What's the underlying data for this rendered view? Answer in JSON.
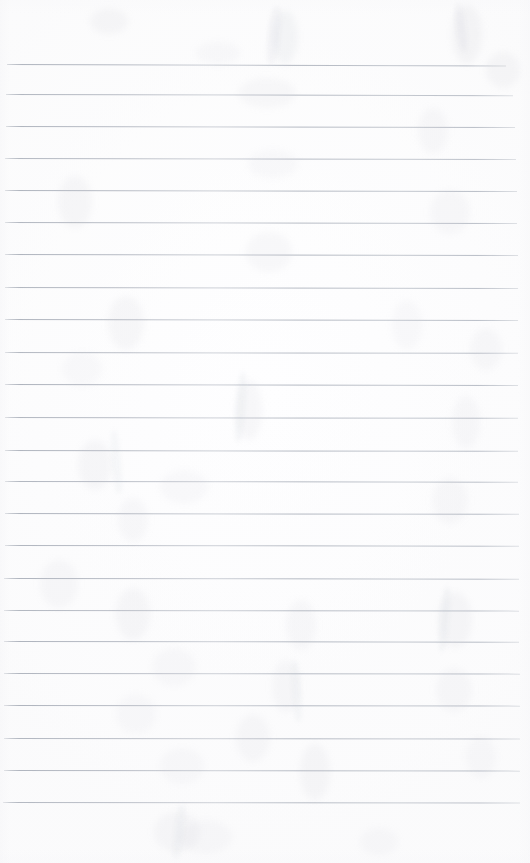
{
  "document": {
    "kind": "scanned-lined-paper",
    "title": "",
    "body_text": "",
    "page_width": 530,
    "page_height": 863,
    "background_color": "#ffffff",
    "is_blank": true
  },
  "ruling": {
    "line_color": "#a9afba",
    "line_thickness_px": 1,
    "line_count": 24,
    "first_line_y": 64,
    "line_spacing_px": 32.1,
    "left_margin_px": 6,
    "right_end_px": 518,
    "margin_rule": false,
    "lines": [
      {
        "y": 64,
        "x": 7,
        "width": 499,
        "tilt": 0.16,
        "opacity": 0.92
      },
      {
        "y": 94,
        "x": 6,
        "width": 507,
        "tilt": 0.13,
        "opacity": 0.88
      },
      {
        "y": 126,
        "x": 6,
        "width": 509,
        "tilt": 0.12,
        "opacity": 0.9
      },
      {
        "y": 158,
        "x": 5,
        "width": 511,
        "tilt": 0.11,
        "opacity": 0.86
      },
      {
        "y": 190,
        "x": 5,
        "width": 512,
        "tilt": 0.12,
        "opacity": 0.9
      },
      {
        "y": 222,
        "x": 5,
        "width": 512,
        "tilt": 0.1,
        "opacity": 0.87
      },
      {
        "y": 254,
        "x": 5,
        "width": 513,
        "tilt": 0.11,
        "opacity": 0.91
      },
      {
        "y": 287,
        "x": 5,
        "width": 513,
        "tilt": 0.1,
        "opacity": 0.88
      },
      {
        "y": 319,
        "x": 5,
        "width": 513,
        "tilt": 0.1,
        "opacity": 0.9
      },
      {
        "y": 352,
        "x": 5,
        "width": 513,
        "tilt": 0.09,
        "opacity": 0.86
      },
      {
        "y": 384,
        "x": 5,
        "width": 513,
        "tilt": 0.1,
        "opacity": 0.92
      },
      {
        "y": 417,
        "x": 5,
        "width": 513,
        "tilt": 0.09,
        "opacity": 0.88
      },
      {
        "y": 450,
        "x": 5,
        "width": 513,
        "tilt": 0.09,
        "opacity": 0.9
      },
      {
        "y": 481,
        "x": 5,
        "width": 513,
        "tilt": 0.08,
        "opacity": 0.87
      },
      {
        "y": 513,
        "x": 5,
        "width": 514,
        "tilt": 0.09,
        "opacity": 0.91
      },
      {
        "y": 545,
        "x": 5,
        "width": 514,
        "tilt": 0.08,
        "opacity": 0.88
      },
      {
        "y": 578,
        "x": 4,
        "width": 515,
        "tilt": 0.08,
        "opacity": 0.9
      },
      {
        "y": 610,
        "x": 4,
        "width": 515,
        "tilt": 0.07,
        "opacity": 0.86
      },
      {
        "y": 641,
        "x": 4,
        "width": 515,
        "tilt": 0.08,
        "opacity": 0.91
      },
      {
        "y": 673,
        "x": 4,
        "width": 516,
        "tilt": 0.07,
        "opacity": 0.88
      },
      {
        "y": 705,
        "x": 4,
        "width": 516,
        "tilt": 0.07,
        "opacity": 0.9
      },
      {
        "y": 738,
        "x": 4,
        "width": 516,
        "tilt": 0.06,
        "opacity": 0.87
      },
      {
        "y": 770,
        "x": 4,
        "width": 516,
        "tilt": 0.07,
        "opacity": 0.89
      },
      {
        "y": 802,
        "x": 3,
        "width": 517,
        "tilt": 0.06,
        "opacity": 0.85
      }
    ]
  },
  "artifacts": {
    "description": "faint scanner ghosting and bleed-through smudges",
    "smudges": [
      {
        "x": 90,
        "y": 8,
        "w": 38,
        "h": 26,
        "opacity": 0.1
      },
      {
        "x": 272,
        "y": 10,
        "w": 26,
        "h": 54,
        "opacity": 0.13
      },
      {
        "x": 452,
        "y": 4,
        "w": 30,
        "h": 60,
        "opacity": 0.12
      },
      {
        "x": 196,
        "y": 42,
        "w": 44,
        "h": 22,
        "opacity": 0.08
      },
      {
        "x": 238,
        "y": 78,
        "w": 58,
        "h": 30,
        "opacity": 0.09
      },
      {
        "x": 486,
        "y": 52,
        "w": 34,
        "h": 36,
        "opacity": 0.1
      },
      {
        "x": 418,
        "y": 108,
        "w": 30,
        "h": 46,
        "opacity": 0.09
      },
      {
        "x": 248,
        "y": 150,
        "w": 50,
        "h": 28,
        "opacity": 0.08
      },
      {
        "x": 58,
        "y": 176,
        "w": 34,
        "h": 52,
        "opacity": 0.1
      },
      {
        "x": 430,
        "y": 190,
        "w": 40,
        "h": 44,
        "opacity": 0.09
      },
      {
        "x": 246,
        "y": 232,
        "w": 46,
        "h": 40,
        "opacity": 0.09
      },
      {
        "x": 108,
        "y": 296,
        "w": 36,
        "h": 54,
        "opacity": 0.1
      },
      {
        "x": 392,
        "y": 300,
        "w": 30,
        "h": 50,
        "opacity": 0.08
      },
      {
        "x": 470,
        "y": 328,
        "w": 32,
        "h": 42,
        "opacity": 0.09
      },
      {
        "x": 62,
        "y": 352,
        "w": 40,
        "h": 34,
        "opacity": 0.08
      },
      {
        "x": 236,
        "y": 380,
        "w": 26,
        "h": 60,
        "opacity": 0.1
      },
      {
        "x": 452,
        "y": 396,
        "w": 28,
        "h": 52,
        "opacity": 0.09
      },
      {
        "x": 78,
        "y": 440,
        "w": 34,
        "h": 50,
        "opacity": 0.1
      },
      {
        "x": 160,
        "y": 470,
        "w": 48,
        "h": 34,
        "opacity": 0.08
      },
      {
        "x": 432,
        "y": 478,
        "w": 36,
        "h": 46,
        "opacity": 0.09
      },
      {
        "x": 118,
        "y": 498,
        "w": 30,
        "h": 44,
        "opacity": 0.09
      },
      {
        "x": 40,
        "y": 560,
        "w": 38,
        "h": 48,
        "opacity": 0.09
      },
      {
        "x": 116,
        "y": 588,
        "w": 34,
        "h": 52,
        "opacity": 0.1
      },
      {
        "x": 286,
        "y": 600,
        "w": 30,
        "h": 50,
        "opacity": 0.09
      },
      {
        "x": 438,
        "y": 592,
        "w": 34,
        "h": 56,
        "opacity": 0.1
      },
      {
        "x": 152,
        "y": 648,
        "w": 44,
        "h": 38,
        "opacity": 0.08
      },
      {
        "x": 272,
        "y": 660,
        "w": 28,
        "h": 52,
        "opacity": 0.09
      },
      {
        "x": 436,
        "y": 668,
        "w": 36,
        "h": 44,
        "opacity": 0.09
      },
      {
        "x": 116,
        "y": 694,
        "w": 40,
        "h": 40,
        "opacity": 0.08
      },
      {
        "x": 236,
        "y": 714,
        "w": 34,
        "h": 48,
        "opacity": 0.09
      },
      {
        "x": 466,
        "y": 736,
        "w": 30,
        "h": 42,
        "opacity": 0.08
      },
      {
        "x": 160,
        "y": 748,
        "w": 44,
        "h": 36,
        "opacity": 0.08
      },
      {
        "x": 300,
        "y": 744,
        "w": 30,
        "h": 56,
        "opacity": 0.1
      },
      {
        "x": 154,
        "y": 812,
        "w": 46,
        "h": 40,
        "opacity": 0.09
      },
      {
        "x": 180,
        "y": 820,
        "w": 52,
        "h": 34,
        "opacity": 0.08
      },
      {
        "x": 360,
        "y": 828,
        "w": 38,
        "h": 28,
        "opacity": 0.07
      }
    ],
    "streaks": [
      {
        "x": 268,
        "y": 6,
        "w": 12,
        "h": 58,
        "rot": 6,
        "opacity": 0.11
      },
      {
        "x": 456,
        "y": 2,
        "w": 10,
        "h": 50,
        "rot": -8,
        "opacity": 0.11
      },
      {
        "x": 236,
        "y": 372,
        "w": 9,
        "h": 70,
        "rot": 4,
        "opacity": 0.1
      },
      {
        "x": 112,
        "y": 430,
        "w": 9,
        "h": 64,
        "rot": -5,
        "opacity": 0.09
      },
      {
        "x": 440,
        "y": 586,
        "w": 9,
        "h": 66,
        "rot": 5,
        "opacity": 0.1
      },
      {
        "x": 292,
        "y": 660,
        "w": 9,
        "h": 62,
        "rot": -4,
        "opacity": 0.09
      },
      {
        "x": 174,
        "y": 804,
        "w": 10,
        "h": 56,
        "rot": 7,
        "opacity": 0.09
      }
    ]
  }
}
